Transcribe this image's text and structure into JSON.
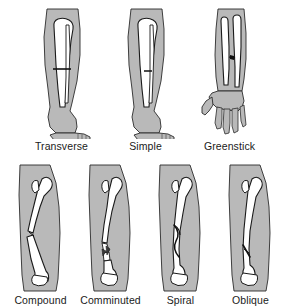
{
  "figure": {
    "background_color": "#ffffff",
    "limb_fill_color": "#b9b9b9",
    "bone_fill_color": "#ffffff",
    "outline_color": "#1a1a1a",
    "label_color": "#1a1a1a"
  },
  "rows": [
    {
      "name": "top-row",
      "items": [
        {
          "id": "transverse",
          "label": "Transverse",
          "limb": "lower-leg-with-foot",
          "bones": "tibia-and-fibula",
          "fracture_line": "horizontal-straight-across-shaft"
        },
        {
          "id": "simple",
          "label": "Simple",
          "limb": "lower-leg-with-foot",
          "bones": "tibia-and-fibula",
          "fracture_line": "single-clean-break-no-displacement"
        },
        {
          "id": "greenstick",
          "label": "Greenstick",
          "limb": "forearm-with-hand",
          "bones": "radius-and-ulna",
          "fracture_line": "incomplete-partial-crack-one-side"
        }
      ]
    },
    {
      "name": "bottom-row",
      "items": [
        {
          "id": "compound",
          "label": "Compound",
          "limb": "thigh",
          "bones": "femur",
          "fracture_line": "displaced-bone-ends-separated-piercing"
        },
        {
          "id": "comminuted",
          "label": "Comminuted",
          "limb": "thigh",
          "bones": "femur",
          "fracture_line": "multiple-bone-fragments-shattered"
        },
        {
          "id": "spiral",
          "label": "Spiral",
          "limb": "thigh",
          "bones": "femur",
          "fracture_line": "twisting-helical-break-along-shaft"
        },
        {
          "id": "oblique",
          "label": "Oblique",
          "limb": "thigh",
          "bones": "femur",
          "fracture_line": "angled-diagonal-break-across-shaft"
        }
      ]
    }
  ]
}
